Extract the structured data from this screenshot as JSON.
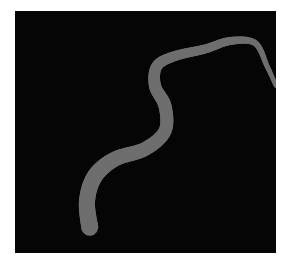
{
  "image": {
    "background": "#050505",
    "ribbon_color": "#6e6e6e",
    "ribbon_edge_color": "#4a4a4a",
    "description": "gray tapering serpentine ribbon on black background",
    "path_points": [
      [
        75,
        218
      ],
      [
        72,
        190
      ],
      [
        80,
        165
      ],
      [
        100,
        148
      ],
      [
        130,
        138
      ],
      [
        150,
        120
      ],
      [
        150,
        95
      ],
      [
        140,
        75
      ],
      [
        142,
        55
      ],
      [
        160,
        45
      ],
      [
        190,
        38
      ],
      [
        215,
        30
      ],
      [
        240,
        32
      ],
      [
        252,
        55
      ],
      [
        261,
        75
      ]
    ],
    "widths": [
      17,
      16,
      16,
      15,
      14,
      13,
      13,
      12,
      11,
      10,
      9,
      8,
      6,
      5,
      4
    ]
  },
  "caption": {
    "text": ""
  }
}
